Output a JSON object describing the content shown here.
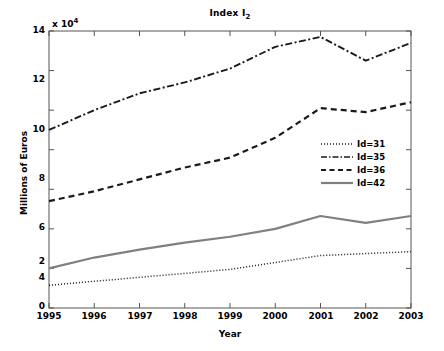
{
  "chart_data": {
    "type": "line",
    "title": "Index I2",
    "title_base": "Index I",
    "title_subscript": "2",
    "xlabel": "Year",
    "ylabel": "Millions of Euros",
    "y_multiplier": "x 10",
    "y_multiplier_exponent": "4",
    "grid": false,
    "legend_position": "center right",
    "x": [
      1995,
      1996,
      1997,
      1998,
      1999,
      2000,
      2001,
      2002,
      2003
    ],
    "xtick_labels": [
      "1995",
      "1996",
      "1997",
      "1998",
      "1999",
      "2000",
      "2001",
      "2002",
      "2003"
    ],
    "ytick_labels": [
      "0",
      "2",
      "4",
      "6",
      "8",
      "10",
      "12",
      "14"
    ],
    "ytick_values": [
      0,
      2,
      4,
      6,
      8,
      10,
      12,
      14
    ],
    "xlim": [
      1995,
      2003
    ],
    "ylim": [
      0,
      14
    ],
    "series": [
      {
        "name": "Id=31",
        "linestyle": "dotted",
        "color": "#1a1a1a",
        "values": [
          1.15,
          1.35,
          1.55,
          1.75,
          1.95,
          2.3,
          2.65,
          2.75,
          2.85
        ]
      },
      {
        "name": "Id=35",
        "linestyle": "dashdot",
        "color": "#1a1a1a",
        "values": [
          9.0,
          10.0,
          10.85,
          11.4,
          12.1,
          13.2,
          13.7,
          12.5,
          13.4
        ]
      },
      {
        "name": "Id=36",
        "linestyle": "dashed",
        "color": "#1a1a1a",
        "values": [
          5.4,
          5.9,
          6.5,
          7.1,
          7.6,
          8.6,
          10.1,
          9.9,
          10.4
        ]
      },
      {
        "name": "Id=42",
        "linestyle": "solid",
        "color": "#808080",
        "values": [
          2.0,
          2.55,
          2.95,
          3.3,
          3.6,
          4.0,
          4.65,
          4.3,
          4.65
        ]
      }
    ],
    "legend_entries": [
      "Id=31",
      "Id=35",
      "Id=36",
      "Id=42"
    ]
  },
  "plot_geometry": {
    "left": 49,
    "top": 31,
    "right": 411,
    "bottom": 308
  }
}
